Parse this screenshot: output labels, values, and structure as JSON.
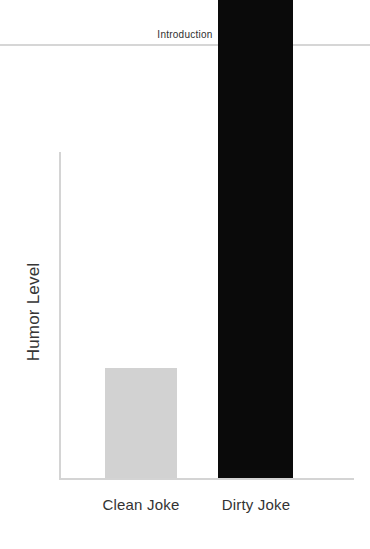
{
  "slide": {
    "header_title": "Introduction",
    "background_color": "#ffffff",
    "rule_color": "#d6d6d6"
  },
  "chart_data": {
    "type": "bar",
    "title": "",
    "subtitle": "",
    "xlabel": "",
    "ylabel": "Humor Level",
    "categories": [
      "Clean Joke",
      "Dirty Joke"
    ],
    "values": [
      110,
      478
    ],
    "value_unit": "px (unlabeled axis)",
    "ylim": [
      0,
      478
    ],
    "grid": false,
    "legend": false,
    "axis_tick_labels": [],
    "bar_colors": [
      "#d2d2d2",
      "#0a0a0a"
    ],
    "axis_color": "#d4d4d4"
  },
  "labels": {
    "y_axis": "Humor Level",
    "category_clean": "Clean Joke",
    "category_dirty": "Dirty Joke"
  }
}
